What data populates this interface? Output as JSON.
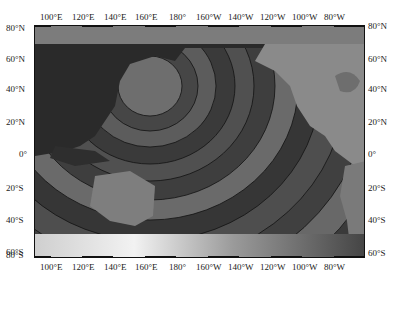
{
  "map": {
    "type": "tsunami travel-time contour map",
    "region": "Pacific Ocean",
    "top_axis_labels": [
      "100°E",
      "120°E",
      "140°E",
      "160°E",
      "180°",
      "160°W",
      "140°W",
      "120°W",
      "100°W",
      "80°W"
    ],
    "bottom_axis_labels": [
      "100°E",
      "120°E",
      "140°E",
      "160°E",
      "180°",
      "160°W",
      "140°W",
      "120°W",
      "100°W",
      "80°W"
    ],
    "left_axis_labels": [
      "80°N",
      "60°N",
      "40°N",
      "20°N",
      "0°",
      "20°S",
      "40°S",
      "60°S",
      "80°S"
    ],
    "right_axis_labels": [
      "80°N",
      "60°N",
      "40°N",
      "20°N",
      "0°",
      "20°S",
      "40°S",
      "60°S",
      "80°S"
    ],
    "colors": {
      "ocean_dark": "#3a3a3a",
      "ocean_mid": "#4e4e4e",
      "ocean_light": "#6b6b6b",
      "land": "#7a7a7a",
      "contour": "#111111"
    }
  }
}
